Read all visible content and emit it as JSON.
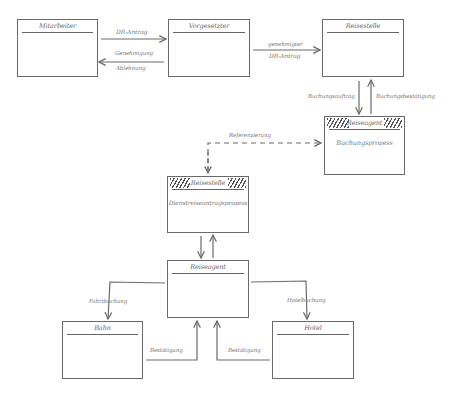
{
  "diagram": {
    "boxes": [
      {
        "id": "mitarbeiter",
        "title": "Mitarbeiter",
        "body": "",
        "hatched": false
      },
      {
        "id": "vorgesetzter",
        "title": "Vorgesetzter",
        "body": "",
        "hatched": false
      },
      {
        "id": "reisestelle-top",
        "title": "Reisestelle",
        "body": "",
        "hatched": false
      },
      {
        "id": "reiseagent-buchung",
        "title": "Reiseagent",
        "body": "Buchungsprozess",
        "hatched": true
      },
      {
        "id": "reisestelle-process",
        "title": "Reisestelle",
        "body": "Dienstreiseantragsprozess",
        "hatched": true
      },
      {
        "id": "reiseagent-center",
        "title": "Reiseagent",
        "body": "",
        "hatched": false
      },
      {
        "id": "bahn",
        "title": "Bahn",
        "body": "",
        "hatched": false
      },
      {
        "id": "hotel",
        "title": "Hotel",
        "body": "",
        "hatched": false
      }
    ],
    "connections": [
      {
        "from": "Mitarbeiter",
        "to": "Vorgesetzter",
        "label": "DR-Antrag",
        "style": "solid"
      },
      {
        "from": "Vorgesetzter",
        "to": "Mitarbeiter",
        "label": "Genehmigung\nAblehnung",
        "label_line1": "Genehmigung",
        "label_line2": "Ablehnung",
        "style": "solid"
      },
      {
        "from": "Vorgesetzter",
        "to": "Reisestelle",
        "label_line1": "genehmigter",
        "label_line2": "DR-Antrag",
        "style": "solid"
      },
      {
        "from": "Reisestelle",
        "to": "Reiseagent",
        "label": "Buchungsauftrag",
        "style": "solid"
      },
      {
        "from": "Reiseagent",
        "to": "Reisestelle",
        "label": "Buchungsbestätigung",
        "style": "solid"
      },
      {
        "from": "Reisestelle (Dienstreiseantragsprozess)",
        "to": "Reiseagent (Buchungsprozess)",
        "label": "Referenzierung",
        "style": "dashed"
      },
      {
        "from": "Reiseagent",
        "to": "Bahn",
        "label": "Fahrtbuchung",
        "style": "solid"
      },
      {
        "from": "Reiseagent",
        "to": "Hotel",
        "label": "Hotelbuchung",
        "style": "solid"
      },
      {
        "from": "Bahn",
        "to": "Reiseagent",
        "label": "Bestätigung",
        "style": "solid"
      },
      {
        "from": "Hotel",
        "to": "Reiseagent",
        "label": "Bestätigung",
        "style": "solid"
      }
    ]
  }
}
